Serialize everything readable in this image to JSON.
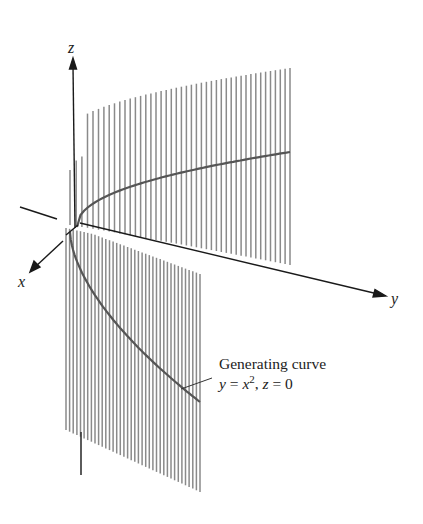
{
  "figure": {
    "type": "parabolic cylinder diagram",
    "axes": {
      "z_label": "z",
      "x_label": "x",
      "y_label": "y"
    },
    "annotation": {
      "line1": "Generating curve",
      "line2_y": "y",
      "line2_eq1": " = ",
      "line2_x": "x",
      "line2_exp": "2",
      "line2_sep": ", ",
      "line2_z": "z",
      "line2_eq2": " = 0"
    },
    "colors": {
      "rulings": "#8a8a8a",
      "curve": "#555555",
      "axes": "#1a1a1a",
      "text": "#222222"
    },
    "equation": "y = x^2, z = 0"
  }
}
